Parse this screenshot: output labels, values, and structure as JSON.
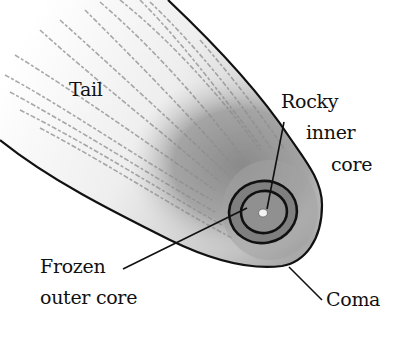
{
  "diagram": {
    "labels": {
      "tail": "Tail",
      "rocky_inner_core": [
        "Rocky",
        "inner",
        "core"
      ],
      "frozen_outer_core": [
        "Frozen",
        "outer core"
      ],
      "coma": "Coma"
    },
    "colors": {
      "background": "#ffffff",
      "outline": "#111111",
      "tail_shade": "#cfcfcf",
      "coma_shade": "#9a9a9a",
      "outer_core_shade": "#7d7d7d",
      "inner_core_shade": "#8e8e8e",
      "nucleus": "#f4f4f4"
    }
  }
}
